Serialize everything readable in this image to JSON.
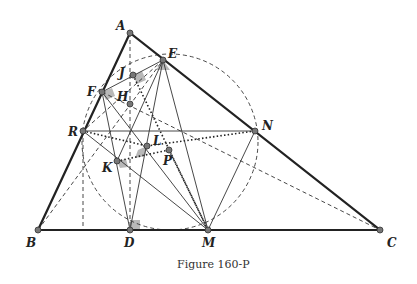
{
  "caption": "Figure 160-P",
  "points": {
    "A": {
      "label": "A",
      "x": 130,
      "y": 33
    },
    "E": {
      "label": "E",
      "x": 163,
      "y": 60
    },
    "J": {
      "label": "J",
      "x": 133,
      "y": 75
    },
    "F": {
      "label": "F",
      "x": 102,
      "y": 92
    },
    "H": {
      "label": "H",
      "x": 130,
      "y": 104
    },
    "R": {
      "label": "R",
      "x": 83,
      "y": 131
    },
    "N": {
      "label": "N",
      "x": 255,
      "y": 131
    },
    "L": {
      "label": "L",
      "x": 147,
      "y": 146
    },
    "P": {
      "label": "P",
      "x": 169,
      "y": 150
    },
    "K": {
      "label": "K",
      "x": 117,
      "y": 161
    },
    "B": {
      "label": "B",
      "x": 38,
      "y": 230
    },
    "D": {
      "label": "D",
      "x": 130,
      "y": 230
    },
    "M": {
      "label": "M",
      "x": 208,
      "y": 230
    },
    "C": {
      "label": "C",
      "x": 380,
      "y": 230
    }
  },
  "colors": {
    "line": "#222222",
    "point": "#666666",
    "shade": "#b0b0b0"
  }
}
